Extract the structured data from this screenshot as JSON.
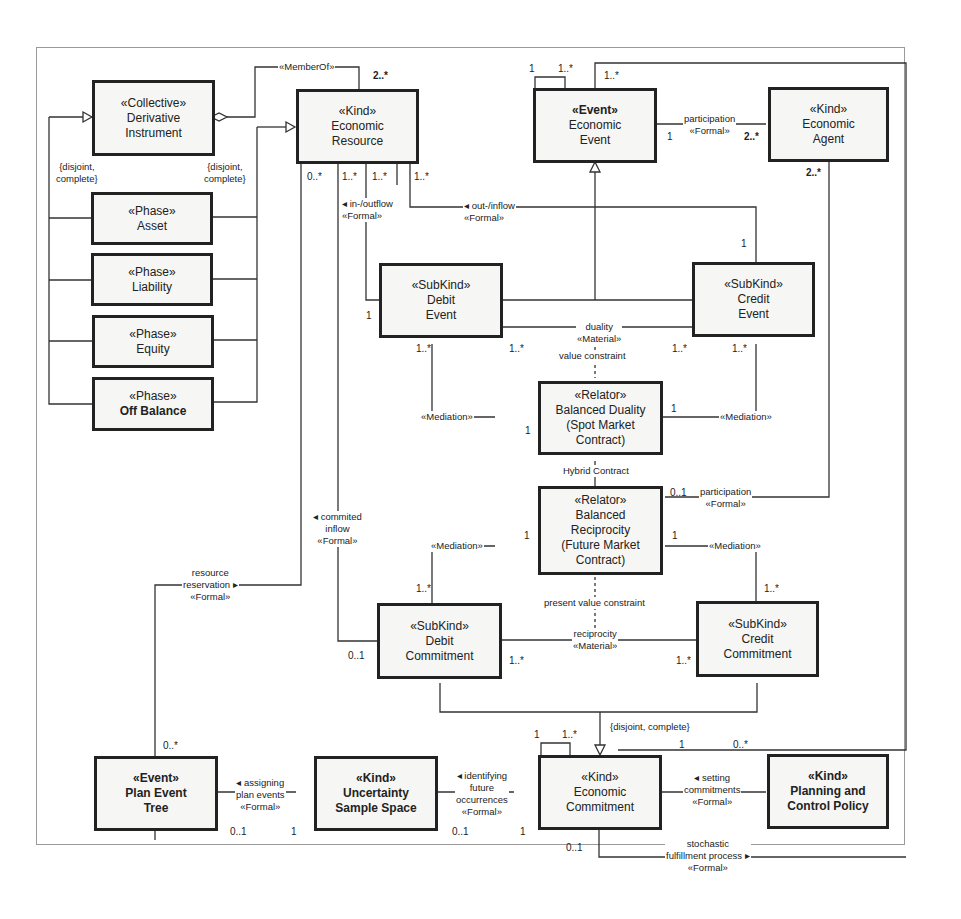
{
  "classes": {
    "derivative_instrument": {
      "stereotype": "«Collective»",
      "name": [
        "Derivative",
        "Instrument"
      ]
    },
    "economic_resource": {
      "stereotype": "«Kind»",
      "name": [
        "Economic",
        "Resource"
      ]
    },
    "asset": {
      "stereotype": "«Phase»",
      "name": [
        "Asset"
      ]
    },
    "liability": {
      "stereotype": "«Phase»",
      "name": [
        "Liability"
      ]
    },
    "equity": {
      "stereotype": "«Phase»",
      "name": [
        "Equity"
      ]
    },
    "off_balance": {
      "stereotype": "«Phase»",
      "name": [
        "Off Balance"
      ]
    },
    "economic_event": {
      "stereotype": "«Event»",
      "name": [
        "Economic",
        "Event"
      ]
    },
    "economic_agent": {
      "stereotype": "«Kind»",
      "name": [
        "Economic",
        "Agent"
      ]
    },
    "debit_event": {
      "stereotype": "«SubKind»",
      "name": [
        "Debit",
        "Event"
      ]
    },
    "credit_event": {
      "stereotype": "«SubKind»",
      "name": [
        "Credit",
        "Event"
      ]
    },
    "balanced_duality": {
      "stereotype": "«Relator»",
      "name": [
        "Balanced Duality",
        "(Spot Market",
        "Contract)"
      ]
    },
    "balanced_reciprocity": {
      "stereotype": "«Relator»",
      "name": [
        "Balanced",
        "Reciprocity",
        "(Future Market",
        "Contract)"
      ]
    },
    "debit_commitment": {
      "stereotype": "«SubKind»",
      "name": [
        "Debit",
        "Commitment"
      ]
    },
    "credit_commitment": {
      "stereotype": "«SubKind»",
      "name": [
        "Credit",
        "Commitment"
      ]
    },
    "plan_event_tree": {
      "stereotype": "«Event»",
      "name": [
        "Plan Event",
        "Tree"
      ]
    },
    "uncertainty_sample_space": {
      "stereotype": "«Kind»",
      "name": [
        "Uncertainty",
        "Sample Space"
      ]
    },
    "economic_commitment": {
      "stereotype": "«Kind»",
      "name": [
        "Economic",
        "Commitment"
      ]
    },
    "planning_control_policy": {
      "stereotype": "«Kind»",
      "name": [
        "Planning and",
        "Control Policy"
      ]
    }
  },
  "labels": {
    "member_of": "«MemberOf»",
    "disjoint_left": [
      "{disjoint,",
      "complete}"
    ],
    "disjoint_right": [
      "{disjoint,",
      "complete}"
    ],
    "participation_top": [
      "participation",
      "«Formal»"
    ],
    "in_outflow": [
      "◂ in-/outflow",
      "«Formal»"
    ],
    "out_inflow": [
      "◂ out-/inflow",
      "«Formal»"
    ],
    "duality": [
      "duality",
      "«Material»"
    ],
    "value_constraint": "value constraint",
    "mediation_bd_left": "«Mediation»",
    "mediation_bd_right": "«Mediation»",
    "hybrid_contract": "Hybrid Contract",
    "participation_mid": [
      "participation",
      "«Formal»"
    ],
    "committed_inflow": [
      "◂ commited",
      "inflow",
      "«Formal»"
    ],
    "mediation_br_left": "«Mediation»",
    "mediation_br_right": "«Mediation»",
    "resource_reservation": [
      "resource",
      "reservation ▸",
      "«Formal»"
    ],
    "present_value_constraint": "present value constraint",
    "reciprocity": [
      "reciprocity",
      "«Material»"
    ],
    "disjoint_bottom": "{disjoint, complete}",
    "assigning_plan_events": [
      "◂ assigning",
      "plan events",
      "«Formal»"
    ],
    "identifying_future": [
      "◂ identifying",
      "future",
      "occurrences",
      "«Formal»"
    ],
    "setting_commitments": [
      "◂ setting",
      "commitments",
      "«Formal»"
    ],
    "stochastic_fulfillment": [
      "stochastic",
      "fulfillment process ▸",
      "«Formal»"
    ]
  },
  "multiplicities": {
    "member_of_er": "2..*",
    "ee_self_1": "1",
    "ee_self_many": "1..*",
    "ee_top_many": "1..*",
    "ee_participation": "1",
    "agent_participation": "2..*",
    "agent_bottom": "2..*",
    "er_0": "0..*",
    "er_1": "1..*",
    "er_2": "1..*",
    "er_3": "1..*",
    "credit_event_top": "1",
    "debit_event_left": "1",
    "debit_event_bottom": "1..*",
    "debit_event_duality": "1..*",
    "credit_event_duality": "1..*",
    "credit_event_bottom": "1..*",
    "bd_left": "1",
    "bd_right": "1",
    "br_participation": "0..1",
    "br_left": "1",
    "br_right": "1",
    "dc_top": "1..*",
    "cc_top": "1..*",
    "dc_left": "0..1",
    "dc_recip": "1..*",
    "cc_recip": "1..*",
    "plan_tree": "0..*",
    "ec_self_1": "1",
    "ec_self_many": "1..*",
    "ec_policy_1": "1",
    "policy_many": "0..*",
    "pet_assign": "0..1",
    "uss_assign": "1",
    "uss_identify": "0..1",
    "ec_identify": "1",
    "ec_bottom": "0..1"
  }
}
